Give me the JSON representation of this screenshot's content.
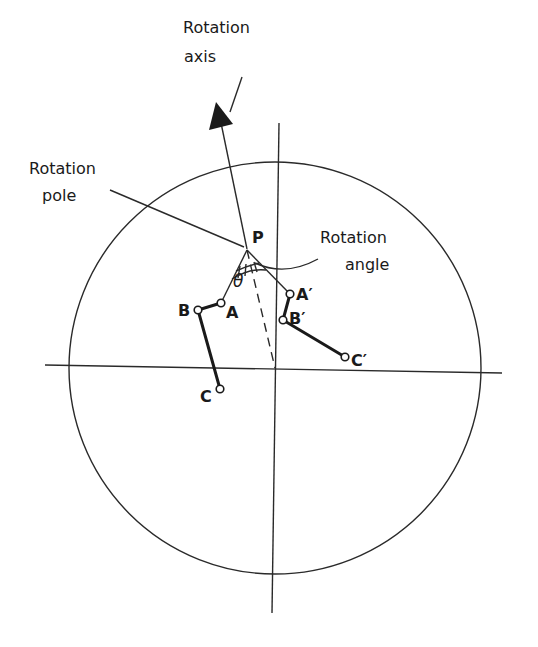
{
  "diagram": {
    "labels": {
      "rotation_axis_line1": "Rotation",
      "rotation_axis_line2": "axis",
      "rotation_pole_line1": "Rotation",
      "rotation_pole_line2": "pole",
      "rotation_angle_line1": "Rotation",
      "rotation_angle_line2": "angle",
      "pole_point": "P",
      "angle_symbol": "θ"
    },
    "points": {
      "A": "A",
      "B": "B",
      "C": "C",
      "A_prime": "A′",
      "B_prime": "B′",
      "C_prime": "C′"
    },
    "geometry": {
      "circle": {
        "cx": 275,
        "cy": 368,
        "r": 206
      },
      "pole": {
        "x": 247,
        "y": 249
      },
      "original_plate": [
        [
          221,
          303
        ],
        [
          198,
          310
        ],
        [
          220,
          389
        ]
      ],
      "rotated_plate": [
        [
          290,
          294
        ],
        [
          283,
          320
        ],
        [
          345,
          357
        ]
      ]
    },
    "colors": {
      "ink": "#1a1a1a",
      "background": "#ffffff"
    }
  }
}
